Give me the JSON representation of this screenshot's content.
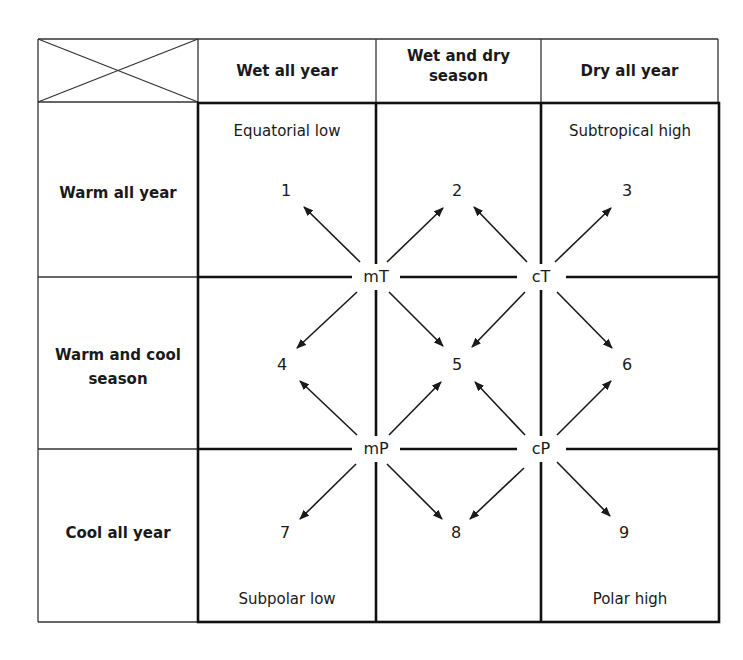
{
  "diagram": {
    "type": "air-mass climate matrix",
    "columns": [
      {
        "label": "Wet all year"
      },
      {
        "label": "Wet and dry season"
      },
      {
        "label": "Dry all year"
      }
    ],
    "rows": [
      {
        "label": "Warm all year"
      },
      {
        "label": "Warm and cool season"
      },
      {
        "label": "Cool all year"
      }
    ],
    "regions": {
      "equatorial_low": "Equatorial low",
      "subtropical_high": "Subtropical high",
      "subpolar_low": "Subpolar low",
      "polar_high": "Polar high"
    },
    "air_masses": {
      "mT": "mT",
      "cT": "cT",
      "mP": "mP",
      "cP": "cP"
    },
    "climate_cells": [
      "1",
      "2",
      "3",
      "4",
      "5",
      "6",
      "7",
      "8",
      "9"
    ],
    "arrows": [
      {
        "from": "mT",
        "to": "1"
      },
      {
        "from": "mT",
        "to": "2"
      },
      {
        "from": "mT",
        "to": "4"
      },
      {
        "from": "mT",
        "to": "5"
      },
      {
        "from": "cT",
        "to": "2"
      },
      {
        "from": "cT",
        "to": "3"
      },
      {
        "from": "cT",
        "to": "5"
      },
      {
        "from": "cT",
        "to": "6"
      },
      {
        "from": "mP",
        "to": "4"
      },
      {
        "from": "mP",
        "to": "5"
      },
      {
        "from": "mP",
        "to": "7"
      },
      {
        "from": "mP",
        "to": "8"
      },
      {
        "from": "cP",
        "to": "5"
      },
      {
        "from": "cP",
        "to": "6"
      },
      {
        "from": "cP",
        "to": "8"
      },
      {
        "from": "cP",
        "to": "9"
      }
    ],
    "colors": {
      "line": "#1a1a1a",
      "background": "#ffffff"
    }
  }
}
